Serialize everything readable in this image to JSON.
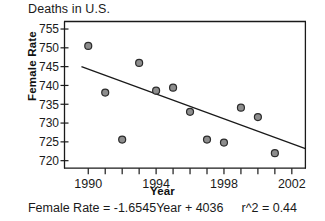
{
  "chart_data": {
    "type": "scatter",
    "title": "Deaths in U.S.",
    "xlabel": "Year",
    "ylabel": "Female Rate",
    "xlim": [
      1988.6,
      2002.8
    ],
    "ylim": [
      718.0,
      757.0
    ],
    "grid": false,
    "legend": "none",
    "x_ticks": [
      1990,
      1994,
      1998,
      2002
    ],
    "x_tick_labels": [
      "1990",
      "1994",
      "1998",
      "2002"
    ],
    "x_minor_ticks": [
      1990,
      1991,
      1992,
      1993,
      1994,
      1995,
      1996,
      1997,
      1998,
      1999,
      2000,
      2001,
      2002
    ],
    "y_ticks": [
      720,
      725,
      730,
      735,
      740,
      745,
      750,
      755
    ],
    "y_tick_labels": [
      "720",
      "725",
      "730",
      "735",
      "740",
      "745",
      "750",
      "755"
    ],
    "x": [
      1990,
      1991,
      1992,
      1993,
      1994,
      1995,
      1996,
      1997,
      1998,
      1999,
      2000,
      2001
    ],
    "y": [
      750.5,
      738.1,
      725.6,
      746.0,
      738.6,
      739.4,
      733.0,
      725.6,
      724.8,
      734.1,
      731.6,
      722.0
    ],
    "points": [
      {
        "x": 1990,
        "y": 750.5
      },
      {
        "x": 1991,
        "y": 738.1
      },
      {
        "x": 1992,
        "y": 725.6
      },
      {
        "x": 1993,
        "y": 746.0
      },
      {
        "x": 1994,
        "y": 738.6
      },
      {
        "x": 1995,
        "y": 739.4
      },
      {
        "x": 1996,
        "y": 733.0
      },
      {
        "x": 1997,
        "y": 725.6
      },
      {
        "x": 1998,
        "y": 724.8
      },
      {
        "x": 1999,
        "y": 734.1
      },
      {
        "x": 2000,
        "y": 731.6
      },
      {
        "x": 2001,
        "y": 722.0
      }
    ],
    "trendline": {
      "slope": -1.6545,
      "intercept": 4036,
      "x_start": 1989.6,
      "y_start": 745.0,
      "x_end": 2002.8,
      "y_end": 723.2
    },
    "annotations": {
      "equation": "Female Rate = -1.6545Year + 4036",
      "r_squared": "r^2 = 0.44"
    },
    "colors": {
      "marker_fill": "#8d8d8d",
      "marker_stroke": "#2b2b2b",
      "line": "#1a1a1a",
      "axis": "#1a1a1a",
      "text": "#1a1a1a",
      "background": "#ffffff"
    }
  }
}
